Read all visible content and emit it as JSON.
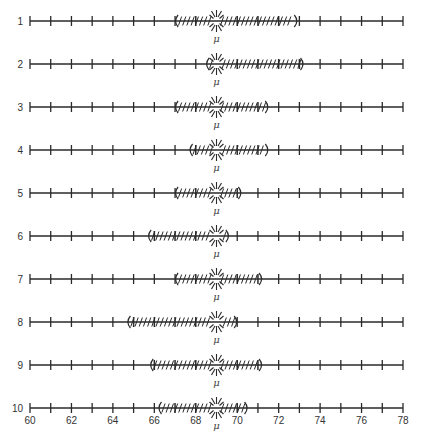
{
  "figure": {
    "title": "",
    "mu_symbol": "μ",
    "mu_value": 69.0
  },
  "chart_data": {
    "type": "interval",
    "title": "",
    "xlabel": "",
    "ylabel": "",
    "xlim": [
      60,
      78
    ],
    "x_ticks": [
      60,
      61,
      62,
      63,
      64,
      65,
      66,
      67,
      68,
      69,
      70,
      71,
      72,
      73,
      74,
      75,
      76,
      77,
      78
    ],
    "x_tick_labels": [
      "60",
      "62",
      "64",
      "66",
      "68",
      "70",
      "72",
      "74",
      "76",
      "78"
    ],
    "x_tick_label_values": [
      60,
      62,
      64,
      66,
      68,
      70,
      72,
      74,
      76,
      78
    ],
    "mu": 69.0,
    "mu_label": "μ",
    "intervals": [
      {
        "label": "1",
        "lower": 67.0,
        "upper": 72.9
      },
      {
        "label": "2",
        "lower": 68.5,
        "upper": 73.2
      },
      {
        "label": "3",
        "lower": 67.0,
        "upper": 71.5
      },
      {
        "label": "4",
        "lower": 67.7,
        "upper": 71.5
      },
      {
        "label": "5",
        "lower": 67.0,
        "upper": 70.2
      },
      {
        "label": "6",
        "lower": 65.7,
        "upper": 69.6
      },
      {
        "label": "7",
        "lower": 67.0,
        "upper": 71.2
      },
      {
        "label": "8",
        "lower": 64.7,
        "upper": 70.0
      },
      {
        "label": "9",
        "lower": 65.8,
        "upper": 71.2
      },
      {
        "label": "10",
        "lower": 66.2,
        "upper": 70.5
      }
    ],
    "grid": false,
    "legend": null
  },
  "colors": {
    "line": "#2a2a2a",
    "text": "#333333"
  }
}
